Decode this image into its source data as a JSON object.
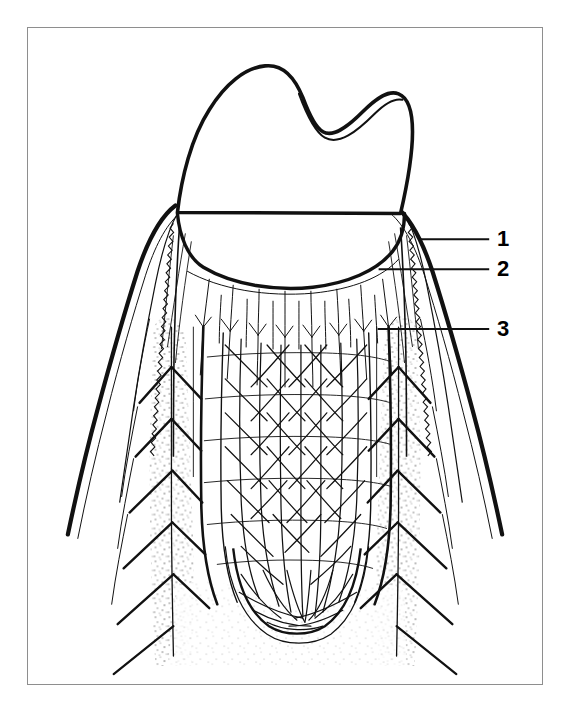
{
  "figure": {
    "domain": "anatomical-line-illustration",
    "style": "black ink line drawing on white background, stippled bone",
    "frame": {
      "border_color": "#8e8e8e",
      "background_color": "#ffffff",
      "x": 27,
      "y": 27,
      "width": 516,
      "height": 658
    },
    "ink_color": "#111111",
    "paper_color": "#ffffff"
  },
  "labels": [
    {
      "id": "1",
      "text": "1",
      "x": 497,
      "y": 228,
      "leader": {
        "x1": 420,
        "y1": 239,
        "x2": 490,
        "y2": 239
      }
    },
    {
      "id": "2",
      "text": "2",
      "x": 497,
      "y": 258,
      "leader": {
        "x1": 379,
        "y1": 269,
        "x2": 490,
        "y2": 269
      }
    },
    {
      "id": "3",
      "text": "3",
      "x": 497,
      "y": 318,
      "leader": {
        "x1": 378,
        "y1": 329,
        "x2": 490,
        "y2": 329
      }
    }
  ],
  "caption": {
    "text": ""
  },
  "structures": [
    {
      "name": "tooth-crown",
      "description": "Two-cusped premolar crown, enamel outline, occlusal groove"
    },
    {
      "name": "gingival-margin",
      "description": "Free gingival margin sweeping across the cervical region"
    },
    {
      "name": "interdental-papilla-left",
      "description": "Left gingival papilla with wavy epithelial border"
    },
    {
      "name": "interdental-papilla-right",
      "description": "Right gingival papilla with wavy epithelial border"
    },
    {
      "name": "periodontal-ligament-plexus",
      "description": "Dense network of vessels in the periodontal ligament space"
    },
    {
      "name": "alveolar-bone-left",
      "description": "Stippled alveolar bone with intraosseous vessels"
    },
    {
      "name": "alveolar-bone-right",
      "description": "Stippled alveolar bone with intraosseous vessels"
    },
    {
      "name": "apical-vascular-plexus",
      "description": "Vessel plexus around root apex"
    }
  ]
}
